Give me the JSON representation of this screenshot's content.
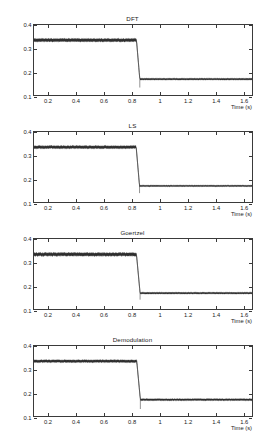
{
  "figure": {
    "subplot_count": 4
  },
  "chart_data": [
    {
      "type": "line",
      "title": "DFT",
      "xlabel": "Time (s)",
      "ylabel": "Amplitude (p.u.)",
      "xlim": [
        0.1,
        1.67
      ],
      "ylim": [
        0.1,
        0.4
      ],
      "xticks": [
        "0.2",
        "0.4",
        "0.6",
        "0.8",
        "1",
        "1.2",
        "1.4",
        "1.6"
      ],
      "xtick_values": [
        0.2,
        0.4,
        0.6,
        0.8,
        1,
        1.2,
        1.4,
        1.6
      ],
      "yticks": [
        "0.1",
        "0.2",
        "0.3",
        "0.4"
      ],
      "ytick_values": [
        0.1,
        0.2,
        0.3,
        0.4
      ],
      "grid": false,
      "legend": null,
      "series": [
        {
          "name": "amplitude",
          "pre_step_level": 0.335,
          "pre_step_band": 0.012,
          "post_step_level": 0.168,
          "post_step_band": 0.006,
          "step_start": 0.838,
          "step_end": 0.862,
          "undershoot": 0.132,
          "color": "#262626"
        }
      ]
    },
    {
      "type": "line",
      "title": "LS",
      "xlabel": "Time (s)",
      "ylabel": "Amplitude (p.u.)",
      "xlim": [
        0.1,
        1.67
      ],
      "ylim": [
        0.1,
        0.4
      ],
      "xticks": [
        "0.2",
        "0.4",
        "0.6",
        "0.8",
        "1",
        "1.2",
        "1.4",
        "1.6"
      ],
      "xtick_values": [
        0.2,
        0.4,
        0.6,
        0.8,
        1,
        1.2,
        1.4,
        1.6
      ],
      "yticks": [
        "0.1",
        "0.2",
        "0.3",
        "0.4"
      ],
      "ytick_values": [
        0.1,
        0.2,
        0.3,
        0.4
      ],
      "grid": false,
      "legend": null,
      "series": [
        {
          "name": "amplitude",
          "pre_step_level": 0.335,
          "pre_step_band": 0.011,
          "post_step_level": 0.169,
          "post_step_band": 0.005,
          "step_start": 0.836,
          "step_end": 0.86,
          "undershoot": 0.138,
          "color": "#262626"
        }
      ]
    },
    {
      "type": "line",
      "title": "Goertzel",
      "xlabel": "Time (s)",
      "ylabel": "Amplitude (p.u.)",
      "xlim": [
        0.1,
        1.67
      ],
      "ylim": [
        0.1,
        0.4
      ],
      "xticks": [
        "0.2",
        "0.4",
        "0.6",
        "0.8",
        "1",
        "1.2",
        "1.4",
        "1.6"
      ],
      "xtick_values": [
        0.2,
        0.4,
        0.6,
        0.8,
        1,
        1.2,
        1.4,
        1.6
      ],
      "yticks": [
        "0.1",
        "0.2",
        "0.3",
        "0.4"
      ],
      "ytick_values": [
        0.1,
        0.2,
        0.3,
        0.4
      ],
      "grid": false,
      "legend": null,
      "series": [
        {
          "name": "amplitude",
          "pre_step_level": 0.334,
          "pre_step_band": 0.013,
          "post_step_level": 0.168,
          "post_step_band": 0.006,
          "step_start": 0.838,
          "step_end": 0.864,
          "undershoot": 0.14,
          "color": "#262626"
        }
      ]
    },
    {
      "type": "line",
      "title": "Demodulation",
      "xlabel": "Time (s)",
      "ylabel": "Amplitude (p.u.)",
      "xlim": [
        0.1,
        1.67
      ],
      "ylim": [
        0.1,
        0.4
      ],
      "xticks": [
        "0.2",
        "0.4",
        "0.6",
        "0.8",
        "1",
        "1.2",
        "1.4",
        "1.6"
      ],
      "xtick_values": [
        0.2,
        0.4,
        0.6,
        0.8,
        1,
        1.2,
        1.4,
        1.6
      ],
      "yticks": [
        "0.1",
        "0.2",
        "0.3",
        "0.4"
      ],
      "ytick_values": [
        0.1,
        0.2,
        0.3,
        0.4
      ],
      "grid": false,
      "legend": null,
      "series": [
        {
          "name": "amplitude",
          "pre_step_level": 0.335,
          "pre_step_band": 0.01,
          "post_step_level": 0.17,
          "post_step_band": 0.007,
          "step_start": 0.84,
          "step_end": 0.866,
          "undershoot": 0.13,
          "color": "#262626"
        }
      ]
    }
  ]
}
